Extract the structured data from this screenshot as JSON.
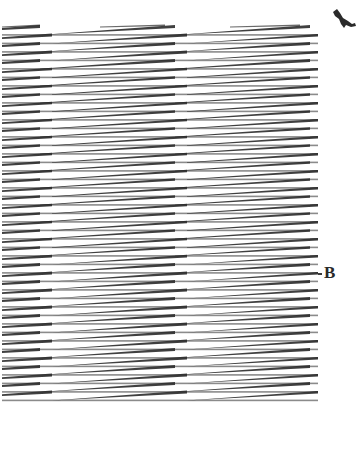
{
  "figure": {
    "type": "line-illusion-plate",
    "rows": 44,
    "row_top_y": 35,
    "row_spacing_px": 8.5,
    "left_x": 2,
    "right_x": 318,
    "stroke_color": "#2b2b2b",
    "background_color": "#ffffff"
  },
  "labels": {
    "b": "B"
  },
  "corner_mark": {
    "icon": "ink-figure-icon"
  }
}
